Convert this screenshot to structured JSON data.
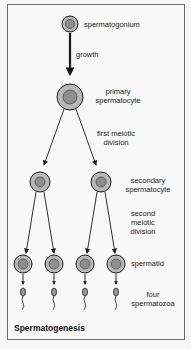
{
  "diagram": {
    "title": "Spermatogenesis",
    "stages": {
      "spermatogonium": "spermatogonium",
      "growth": "growth",
      "primary_line1": "primary",
      "primary_line2": "spermatocyte",
      "first_div_line1": "first meiotic",
      "first_div_line2": "division",
      "secondary_line1": "secondary",
      "secondary_line2": "spermatocyte",
      "second_div_line1": "second",
      "second_div_line2": "meiotic",
      "second_div_line3": "division",
      "spermatid": "spermatid",
      "spermatozoa_line1": "four",
      "spermatozoa_line2": "spermatozoa"
    },
    "colors": {
      "cell_outer": "#b8b8b8",
      "cell_nucleus": "#8e8e8e",
      "stroke": "#1a1a1a",
      "frame": "#6a6a6a"
    }
  }
}
